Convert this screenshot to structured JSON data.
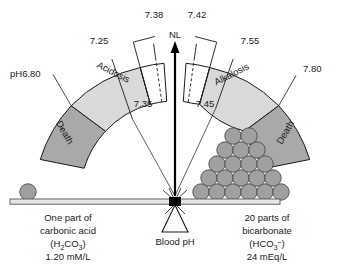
{
  "diagram": {
    "colors": {
      "death_band": "#a9a9a9",
      "disorder_band": "#d9d9d9",
      "normal_band": "#ffffff",
      "circle_fill": "#a0a0a0",
      "stroke": "#1a1a1a",
      "beam": "#d0d0d0"
    },
    "scale_labels": {
      "left_end": "pH6.80",
      "acidosis_inner": "7.25",
      "acidosis_normal_upper": "7.38",
      "acidosis_normal_lower": "7.35",
      "alkalosis_normal_lower": "7.45",
      "alkalosis_normal_upper": "7.42",
      "alkalosis_inner": "7.55",
      "right_end": "7.80"
    },
    "bands": {
      "left_death": "Death",
      "acidosis": "Acidosis",
      "normal_marker": "NL",
      "alkalosis": "Alkalosis",
      "right_death": "Death"
    },
    "fulcrum_label": "Blood pH",
    "left_pan": {
      "line1": "One part of",
      "line2": "carbonic acid",
      "formula_main": "(H",
      "formula_sub1": "2",
      "formula_mid": "CO",
      "formula_sub2": "3",
      "formula_close": ")",
      "value": "1.20 mM/L",
      "weight_count": 1
    },
    "right_pan": {
      "line1": "20 parts of",
      "line2": "bicarbonate",
      "formula_main": "(HCO",
      "formula_sub": "3",
      "formula_sup": "–",
      "formula_close": ")",
      "value": "24 mEq/L",
      "weight_count": 20,
      "pyramid_rows": [
        2,
        3,
        4,
        5,
        6
      ]
    }
  }
}
